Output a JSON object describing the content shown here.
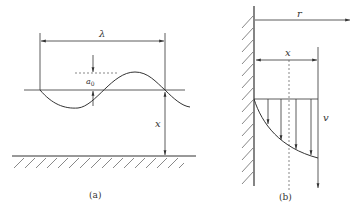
{
  "figure": {
    "panel_a": {
      "caption": "(a)",
      "labels": {
        "wavelength": "λ",
        "amplitude": "a",
        "amplitude_subscript": "0",
        "distance": "x"
      }
    },
    "panel_b": {
      "caption": "(b)",
      "labels": {
        "radial": "r",
        "distance": "x",
        "velocity": "v"
      }
    },
    "colors": {
      "line": "#333333",
      "background": "#ffffff"
    }
  }
}
